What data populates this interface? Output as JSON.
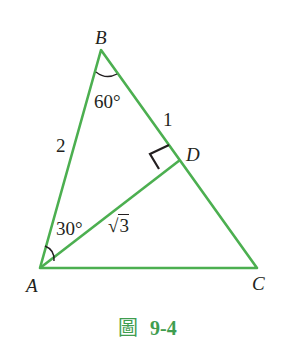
{
  "figure": {
    "caption_prefix": "圖",
    "caption_number": "9-4",
    "line_color": "#4caf50",
    "caption_color": "#3f9d4f"
  },
  "vertices": {
    "A": "A",
    "B": "B",
    "C": "C",
    "D": "D"
  },
  "labels": {
    "angle_B": "60°",
    "angle_A": "30°",
    "side_AB": "2",
    "side_BD": "1",
    "side_AD_radical": "√",
    "side_AD_radicand": "3"
  }
}
